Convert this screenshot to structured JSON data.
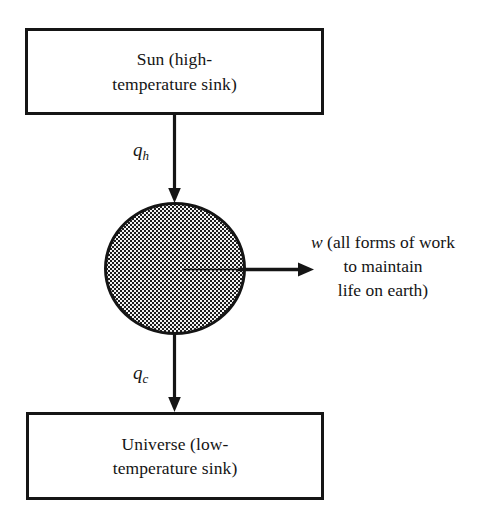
{
  "diagram": {
    "type": "block-flow-diagram",
    "background_color": "#ffffff",
    "line_color": "#151515",
    "fill_color": "#f4f4f4"
  },
  "nodes": {
    "source": {
      "id": "sun-box",
      "label": "Sun (high-\ntemperature sink)",
      "line1": "Sun (high-",
      "line2": "temperature sink)",
      "shape": "rectangle"
    },
    "system": {
      "id": "system-circle",
      "label": "",
      "shape": "circle",
      "fill": "stippled"
    },
    "sink": {
      "id": "universe-box",
      "label": "Universe (low-\ntemperature sink)",
      "line1": "Universe (low-",
      "line2": "temperature sink)",
      "shape": "rectangle"
    }
  },
  "flows": {
    "heat_in": {
      "symbol": "q",
      "subscript": "h",
      "direction": "down",
      "from": "source",
      "to": "system"
    },
    "heat_out": {
      "symbol": "q",
      "subscript": "c",
      "direction": "down",
      "from": "system",
      "to": "sink"
    },
    "work_out": {
      "symbol": "w",
      "direction": "right",
      "from": "system",
      "line1": "w (all forms of work",
      "line2": "to maintain",
      "line3": "life on earth)",
      "text_rest_line1": " (all forms of work"
    }
  }
}
